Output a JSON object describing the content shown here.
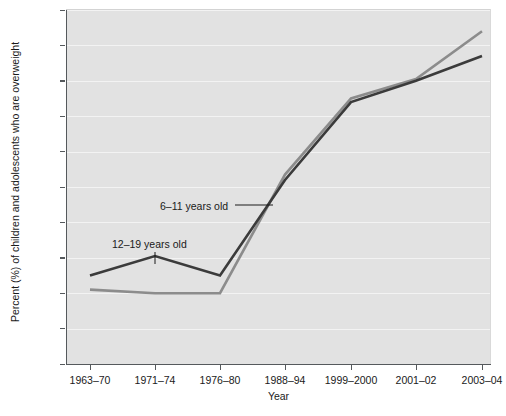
{
  "chart_data": {
    "type": "line",
    "title": "",
    "xlabel": "Year",
    "ylabel": "Percent (%) of children and adolescents who are overweight",
    "categories": [
      "1963–70",
      "1971–74",
      "1976–80",
      "1988–94",
      "1999–2000",
      "2001–02",
      "2003–04"
    ],
    "ylim": [
      0,
      20
    ],
    "yticks": [
      "0",
      "2",
      "4",
      "6",
      "8",
      "10",
      "12",
      "14",
      "16",
      "18",
      "20"
    ],
    "grid": "horizontal",
    "legend_position": "inline-annotations",
    "series": [
      {
        "name": "6–11 years old",
        "color": "#8c8c8c",
        "values": [
          4.2,
          4.0,
          4.0,
          10.7,
          15.0,
          16.1,
          18.8
        ]
      },
      {
        "name": "12–19 years old",
        "color": "#3b3b3b",
        "values": [
          5.0,
          6.1,
          5.0,
          10.4,
          14.8,
          16.0,
          17.4
        ]
      }
    ],
    "annotations": [
      {
        "text": "6–11 years old",
        "series": "6–11 years old"
      },
      {
        "text": "12–19 years old",
        "series": "12–19 years old"
      }
    ]
  },
  "axis": {
    "y_title": "Percent (%) of children and adolescents who are overweight",
    "x_title": "Year"
  },
  "colors": {
    "plot_background": "#e2e2e2",
    "gridline": "#f3f3f3",
    "axis": "#55595c",
    "series_6_11": "#8c8c8c",
    "series_12_19": "#3b3b3b",
    "text": "#1a1a1a"
  }
}
